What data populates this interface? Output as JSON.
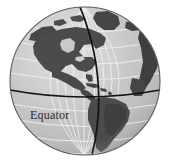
{
  "figure": {
    "name": "globe-illustration",
    "background_color": "#ffffff"
  },
  "globe": {
    "center_x": 85,
    "center_y": 81,
    "radius_x": 75,
    "radius_y": 74,
    "ocean_color": "#c9c9c9",
    "ocean_highlight_color": "#dcdcdc",
    "ocean_shadow_color": "#a9a9a9",
    "land_color": "#4b4b4b",
    "land_dark_color": "#3c3c3c",
    "outline_color": "#555555",
    "graticule_color": "#f2f2f2",
    "graticule_width": 0.9
  },
  "lines": {
    "equator": {
      "label": "Equator",
      "color": "#111111",
      "width": 1.7,
      "latitude": 0
    },
    "meridian": {
      "label": "Prime meridian",
      "color": "#111111",
      "width": 1.7
    }
  },
  "graticule": {
    "parallels_labels": [
      "60N",
      "45N",
      "30N",
      "15N",
      "0",
      "15S",
      "30S",
      "45S",
      "60S"
    ],
    "meridians_count": 9,
    "parallels_count": 9
  },
  "landmasses": [
    {
      "name": "North America"
    },
    {
      "name": "Greenland"
    },
    {
      "name": "Central America"
    },
    {
      "name": "Caribbean islands"
    },
    {
      "name": "South America"
    },
    {
      "name": "Western Africa and Europe rim"
    }
  ]
}
